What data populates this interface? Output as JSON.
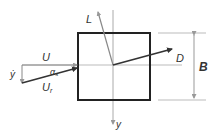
{
  "diagram": {
    "labels": {
      "lift": "L",
      "drag": "D",
      "wind_speed": "U",
      "relative_wind": "U",
      "relative_wind_sub": "r",
      "vertical_velocity": "ẏ",
      "angle": "α",
      "angle_sub": "s",
      "displacement_axis": "y",
      "width": "B"
    },
    "colors": {
      "body_outline": "#222222",
      "centerline": "#aaaaaa",
      "arrow_dark": "#333333",
      "arrow_light": "#999999",
      "text": "#333333"
    }
  }
}
